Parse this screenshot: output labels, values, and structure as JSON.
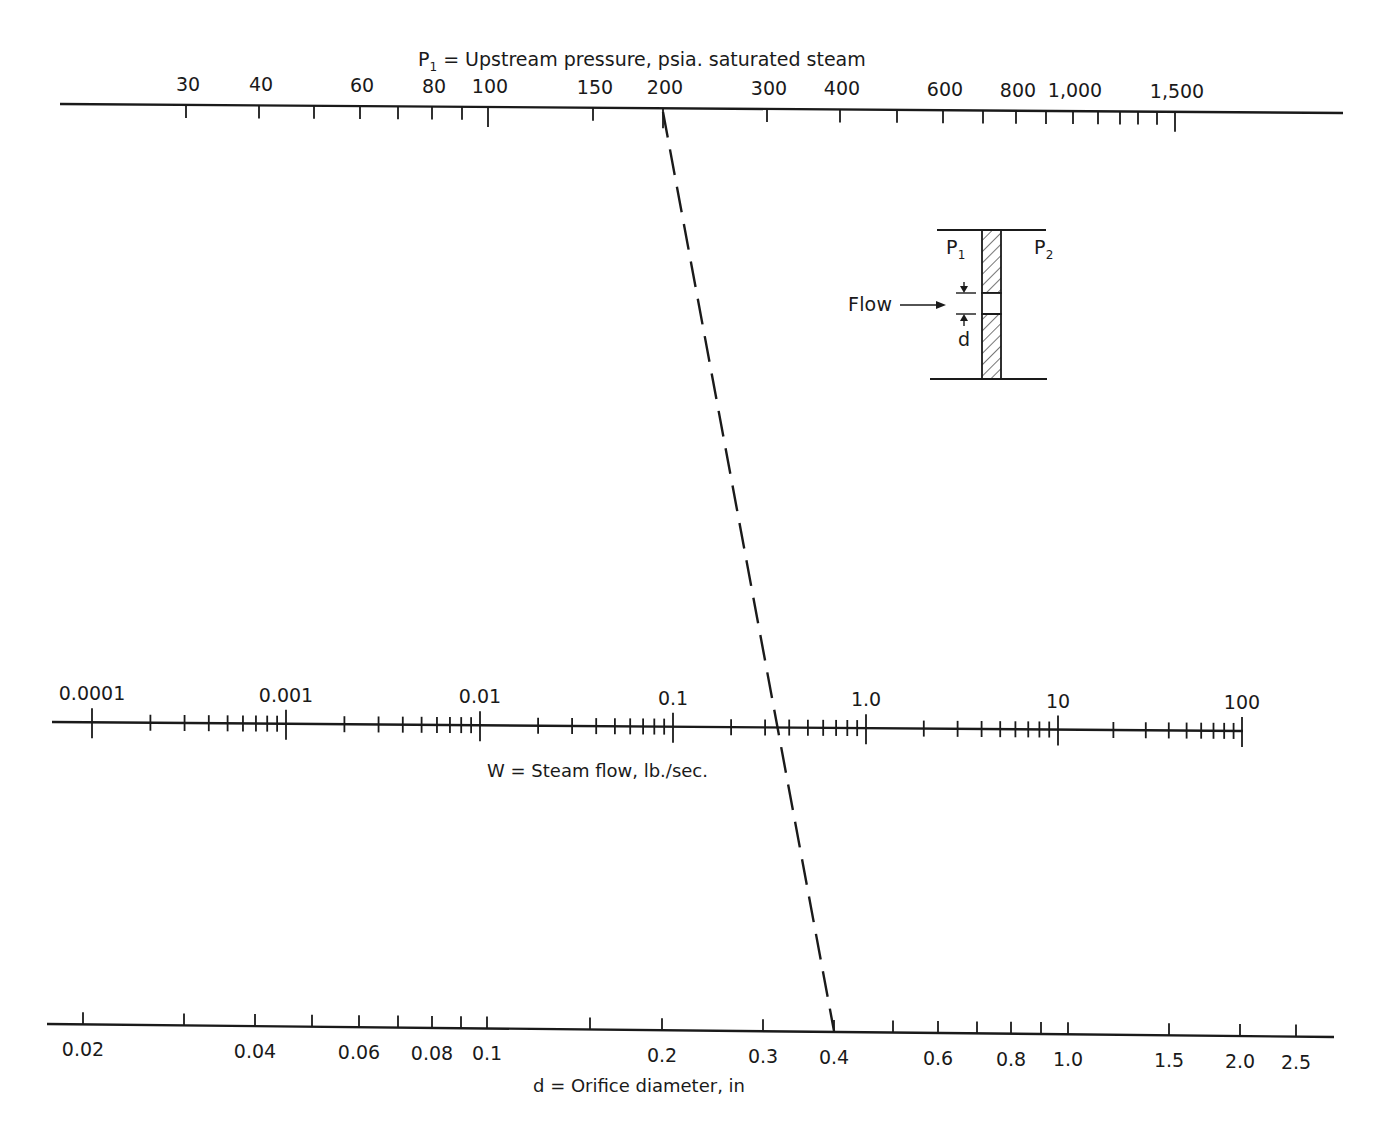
{
  "chart_data": {
    "type": "nomogram",
    "scales": [
      {
        "id": "P1",
        "symbol": "P",
        "subscript": "1",
        "title": " = Upstream pressure, psia. saturated steam",
        "position": "top",
        "scale": "log",
        "labeled_ticks": [
          "30",
          "40",
          "60",
          "80",
          "100",
          "150",
          "200",
          "300",
          "400",
          "600",
          "800",
          "1,000",
          "1,500"
        ],
        "tick_values": [
          30,
          40,
          50,
          60,
          70,
          80,
          90,
          100,
          150,
          200,
          300,
          400,
          500,
          600,
          700,
          800,
          900,
          1000,
          1100,
          1200,
          1300,
          1400,
          1500
        ],
        "range": [
          30,
          1500
        ]
      },
      {
        "id": "W",
        "symbol": "W",
        "title": "W = Steam flow, lb./sec.",
        "position": "middle",
        "scale": "log",
        "labeled_ticks": [
          "0.0001",
          "0.001",
          "0.01",
          "0.1",
          "1.0",
          "10",
          "100"
        ],
        "range": [
          0.0001,
          100
        ]
      },
      {
        "id": "d",
        "symbol": "d",
        "title": "d = Orifice diameter, in",
        "position": "bottom",
        "scale": "log",
        "labeled_ticks": [
          "0.02",
          "0.04",
          "0.06",
          "0.08",
          "0.1",
          "0.2",
          "0.3",
          "0.4",
          "0.6",
          "0.8",
          "1.0",
          "1.5",
          "2.0",
          "2.5"
        ],
        "tick_values": [
          0.02,
          0.03,
          0.04,
          0.05,
          0.06,
          0.07,
          0.08,
          0.09,
          0.1,
          0.15,
          0.2,
          0.3,
          0.4,
          0.5,
          0.6,
          0.7,
          0.8,
          0.9,
          1.0,
          1.5,
          2.0,
          2.5
        ],
        "range": [
          0.02,
          2.5
        ]
      }
    ],
    "example_isopleth": {
      "style": "dashed",
      "P1_psia": 200,
      "W_lb_per_sec": 0.33,
      "d_in": 0.4
    },
    "inset": {
      "labels": [
        "P1",
        "P2",
        "Flow",
        "d"
      ],
      "description": "Orifice plate schematic with flow arrow and diameter d"
    }
  },
  "top_axis": {
    "symbol": "P",
    "subscript": "1",
    "title": " = Upstream pressure, psia. saturated steam",
    "ticks": [
      {
        "v": "30",
        "x": 186,
        "label": "30",
        "major": true
      },
      {
        "v": "40",
        "x": 259,
        "label": "40",
        "major": true
      },
      {
        "v": "50",
        "x": 314,
        "label": ""
      },
      {
        "v": "60",
        "x": 360,
        "label": "60",
        "major": true
      },
      {
        "v": "70",
        "x": 398,
        "label": ""
      },
      {
        "v": "80",
        "x": 432,
        "label": "80",
        "major": true
      },
      {
        "v": "90",
        "x": 462,
        "label": ""
      },
      {
        "v": "100",
        "x": 488,
        "label": "100",
        "major": true
      },
      {
        "v": "150",
        "x": 593,
        "label": "150",
        "major": true
      },
      {
        "v": "200",
        "x": 663,
        "label": "200",
        "major": true
      },
      {
        "v": "300",
        "x": 767,
        "label": "300",
        "major": true
      },
      {
        "v": "400",
        "x": 840,
        "label": "400",
        "major": true
      },
      {
        "v": "500",
        "x": 897,
        "label": ""
      },
      {
        "v": "600",
        "x": 943,
        "label": "600",
        "major": true
      },
      {
        "v": "700",
        "x": 983,
        "label": ""
      },
      {
        "v": "800",
        "x": 1016,
        "label": "800",
        "major": true
      },
      {
        "v": "900",
        "x": 1046,
        "label": ""
      },
      {
        "v": "1000",
        "x": 1073,
        "label": "1,000",
        "major": true
      },
      {
        "v": "1100",
        "x": 1098,
        "label": ""
      },
      {
        "v": "1200",
        "x": 1120,
        "label": ""
      },
      {
        "v": "1300",
        "x": 1138,
        "label": ""
      },
      {
        "v": "1400",
        "x": 1157,
        "label": ""
      },
      {
        "v": "1500",
        "x": 1175,
        "label": "1,500",
        "major": true
      }
    ]
  },
  "middle_axis": {
    "title": "W = Steam flow, lb./sec.",
    "decades": [
      {
        "label": "0.0001",
        "x": 92
      },
      {
        "label": "0.001",
        "x": 286
      },
      {
        "label": "0.01",
        "x": 480
      },
      {
        "label": "0.1",
        "x": 673
      },
      {
        "label": "1.0",
        "x": 866
      },
      {
        "label": "10",
        "x": 1058
      },
      {
        "label": "100",
        "x": 1242
      }
    ]
  },
  "bottom_axis": {
    "title": "d = Orifice diameter, in",
    "ticks": [
      {
        "v": "0.02",
        "x": 83,
        "label": "0.02"
      },
      {
        "v": "0.03",
        "x": 184,
        "label": ""
      },
      {
        "v": "0.04",
        "x": 255,
        "label": "0.04"
      },
      {
        "v": "0.05",
        "x": 312,
        "label": ""
      },
      {
        "v": "0.06",
        "x": 359,
        "label": "0.06"
      },
      {
        "v": "0.07",
        "x": 398,
        "label": ""
      },
      {
        "v": "0.08",
        "x": 432,
        "label": "0.08"
      },
      {
        "v": "0.09",
        "x": 461,
        "label": ""
      },
      {
        "v": "0.1",
        "x": 487,
        "label": "0.1"
      },
      {
        "v": "0.15",
        "x": 590,
        "label": ""
      },
      {
        "v": "0.2",
        "x": 662,
        "label": "0.2"
      },
      {
        "v": "0.3",
        "x": 763,
        "label": "0.3"
      },
      {
        "v": "0.4",
        "x": 834,
        "label": "0.4"
      },
      {
        "v": "0.5",
        "x": 893,
        "label": ""
      },
      {
        "v": "0.6",
        "x": 938,
        "label": "0.6"
      },
      {
        "v": "0.7",
        "x": 977,
        "label": ""
      },
      {
        "v": "0.8",
        "x": 1011,
        "label": "0.8"
      },
      {
        "v": "0.9",
        "x": 1041,
        "label": ""
      },
      {
        "v": "1.0",
        "x": 1068,
        "label": "1.0"
      },
      {
        "v": "1.5",
        "x": 1169,
        "label": "1.5"
      },
      {
        "v": "2.0",
        "x": 1240,
        "label": "2.0"
      },
      {
        "v": "2.5",
        "x": 1296,
        "label": "2.5"
      }
    ]
  },
  "inset": {
    "p1_symbol": "P",
    "p1_sub": "1",
    "p2_symbol": "P",
    "p2_sub": "2",
    "flow_label": "Flow",
    "d_label": "d"
  },
  "colors": {
    "ink": "#1a1a1a",
    "background": "#ffffff"
  }
}
